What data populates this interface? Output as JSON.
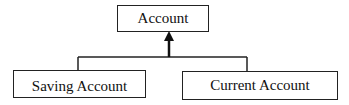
{
  "diagram": {
    "type": "inheritance",
    "parent": {
      "label": "Account"
    },
    "children": [
      {
        "label": "Saving Account"
      },
      {
        "label": "Current Account"
      }
    ],
    "edge_style": "arrow-to-parent"
  }
}
